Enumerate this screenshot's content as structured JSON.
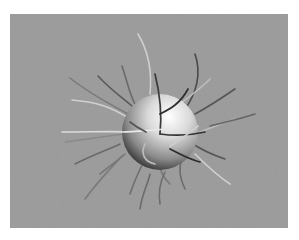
{
  "image": {
    "subject": "3D rendered sphere with hair-like strands",
    "colors": {
      "background": "#ffffff",
      "panel": "#9a9a9a",
      "sphere_highlight": "#ffffff",
      "sphere_shadow": "#1a1a1a",
      "strand_light": "#d8d8d8",
      "strand_dark": "#3a3a3a"
    }
  }
}
